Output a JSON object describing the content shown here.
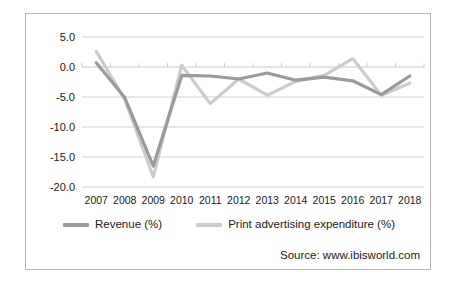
{
  "chart_data": {
    "type": "line",
    "title": "",
    "subtitle": "",
    "xlabel": "",
    "ylabel": "",
    "categories": [
      "2007",
      "2008",
      "2009",
      "2010",
      "2011",
      "2012",
      "2013",
      "2014",
      "2015",
      "2016",
      "2017",
      "2018"
    ],
    "x": [
      2007,
      2008,
      2009,
      2010,
      2011,
      2012,
      2013,
      2014,
      2015,
      2016,
      2017,
      2018
    ],
    "ylim": [
      -20.0,
      5.0
    ],
    "ytick_labels": [
      "5.0",
      "0.0",
      "-5.0",
      "-10.0",
      "-15.0",
      "-20.0"
    ],
    "ytick_values": [
      5.0,
      0.0,
      -5.0,
      -10.0,
      -15.0,
      -20.0
    ],
    "grid": true,
    "grid_axis": "y",
    "legend_position": "bottom",
    "series": [
      {
        "name": "Revenue (%)",
        "color": "#9a9a9a",
        "values": [
          0.7,
          -5.1,
          -16.5,
          -1.4,
          -1.5,
          -2.0,
          -1.0,
          -2.2,
          -1.7,
          -2.3,
          -4.6,
          -1.5
        ]
      },
      {
        "name": "Print advertising expenditure (%)",
        "color": "#cccccc",
        "values": [
          2.6,
          -5.4,
          -18.3,
          0.3,
          -6.1,
          -2.0,
          -4.7,
          -2.4,
          -1.4,
          1.4,
          -4.7,
          -2.7
        ]
      }
    ],
    "annotations": [
      "Source: www.ibisworld.com"
    ]
  },
  "legend": {
    "items": [
      {
        "label": "Revenue (%)",
        "color": "#9a9a9a"
      },
      {
        "label": "Print advertising expenditure (%)",
        "color": "#cccccc"
      }
    ]
  },
  "source": {
    "text": "Source: www.ibisworld.com"
  },
  "axis": {
    "y_labels": [
      "5.0",
      "0.0",
      "-5.0",
      "-10.0",
      "-15.0",
      "-20.0"
    ],
    "x_labels": [
      "2007",
      "2008",
      "2009",
      "2010",
      "2011",
      "2012",
      "2013",
      "2014",
      "2015",
      "2016",
      "2017",
      "2018"
    ]
  },
  "colors": {
    "revenue": "#9a9a9a",
    "print_advertising": "#cccccc",
    "grid": "#c9c9c9",
    "border": "#b7b7b7",
    "text": "#1a1a1a"
  }
}
